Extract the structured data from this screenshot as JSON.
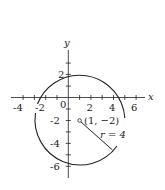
{
  "diagram": {
    "type": "circle-on-coordinate-plane",
    "axes": {
      "x_label": "x",
      "y_label": "y",
      "origin_label": "0",
      "x_ticks": [
        "-4",
        "-2",
        "2",
        "4",
        "6"
      ],
      "y_ticks": [
        "2",
        "-2",
        "-4",
        "-6"
      ]
    },
    "center": {
      "x": 1,
      "y": -2,
      "label": "(1, −2)"
    },
    "radius": {
      "value": 4,
      "label": "r = 4"
    },
    "colors": {
      "stroke": "#222222",
      "background": "#ffffff"
    }
  }
}
